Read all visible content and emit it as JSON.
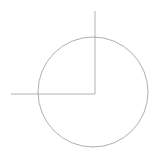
{
  "canvas": {
    "width": 163,
    "height": 162,
    "background_color": "#ffffff",
    "title": "circle-with-perpendicular-rays"
  },
  "style": {
    "stroke_color": "#9a9a9a",
    "circle_stroke_color": "#9a9a9a",
    "ray_stroke_color": "#a0a0a0",
    "stroke_width": 0.8
  },
  "figure": {
    "type": "geometric-line-drawing",
    "circle": {
      "name": "circle",
      "center_x": 93,
      "center_y": 92,
      "radius": 55
    },
    "vertex": {
      "name": "right-angle-vertex",
      "x": 95,
      "y": 94
    },
    "rays": [
      {
        "name": "vertical-ray",
        "x1": 95,
        "y1": 11,
        "x2": 95,
        "y2": 94,
        "direction": "up"
      },
      {
        "name": "horizontal-ray",
        "x1": 11,
        "y1": 94,
        "x2": 95,
        "y2": 94,
        "direction": "left"
      }
    ],
    "angle_degrees": 90,
    "labels": []
  },
  "chart_data": {
    "type": "scatter",
    "title": "",
    "xlabel": "",
    "ylabel": "",
    "xlim": [
      0,
      163
    ],
    "ylim": [
      0,
      162
    ],
    "grid": false,
    "legend": "none",
    "annotations": [],
    "shapes": [
      {
        "kind": "circle",
        "cx": 93,
        "cy": 92,
        "r": 55,
        "stroke": "#9a9a9a",
        "fill": "none"
      },
      {
        "kind": "line",
        "x1": 95,
        "y1": 11,
        "x2": 95,
        "y2": 94,
        "stroke": "#a0a0a0"
      },
      {
        "kind": "line",
        "x1": 11,
        "y1": 94,
        "x2": 95,
        "y2": 94,
        "stroke": "#a0a0a0"
      }
    ]
  }
}
